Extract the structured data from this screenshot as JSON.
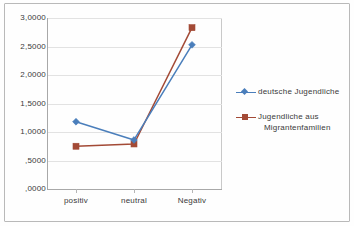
{
  "chart_data": {
    "type": "line",
    "title": "",
    "xlabel": "",
    "ylabel": "",
    "categories": [
      "positiv",
      "neutral",
      "Negativ"
    ],
    "series": [
      {
        "name": "deutsche Jugendliche",
        "color": "#4A7EBB",
        "marker": "diamond",
        "values": [
          1.18,
          0.86,
          2.53
        ]
      },
      {
        "name": "Jugendliche aus Migrantenfamilien",
        "color": "#A34A36",
        "marker": "square",
        "values": [
          0.75,
          0.79,
          2.83
        ]
      }
    ],
    "ylim": [
      0,
      3
    ],
    "ytick_values": [
      3.0,
      2.5,
      2.0,
      1.5,
      1.0,
      0.5,
      0.0
    ],
    "ytick_labels": [
      "3,0000",
      "2,5000",
      "2,0000",
      "1,5000",
      "1,0000",
      ",5000",
      ",0000"
    ],
    "grid": true,
    "legend_position": "right"
  },
  "legend": {
    "entries": [
      {
        "key_icon": "line-diamond-marker-icon",
        "label_line1": "deutsche Jugendliche",
        "label_line2": ""
      },
      {
        "key_icon": "line-square-marker-icon",
        "label_line1": "Jugendliche aus",
        "label_line2": "Migrantenfamilien"
      }
    ]
  },
  "colors": {
    "series_blue": "#4A7EBB",
    "series_red": "#A34A36",
    "gridline": "#e2e2e2",
    "axis": "#a8a8a8",
    "text": "#3a3a3a"
  }
}
